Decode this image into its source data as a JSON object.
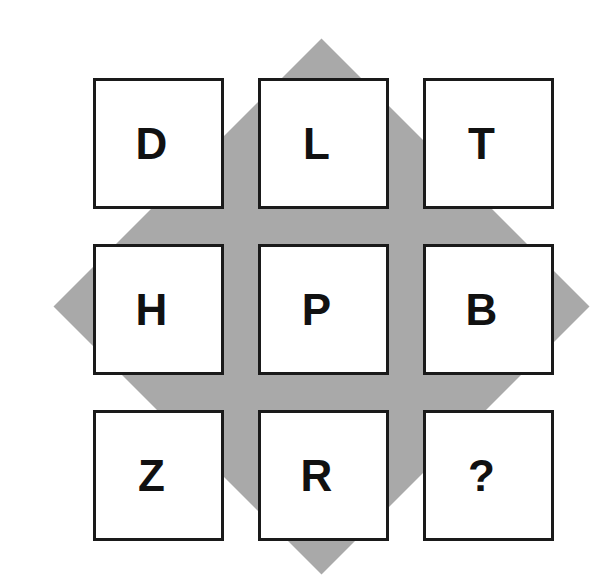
{
  "puzzle": {
    "type": "letter-grid-reasoning-puzzle",
    "background_color": "#ffffff",
    "diamond": {
      "name": "gray-diamond-background",
      "color": "#a9a9a9",
      "center_x": 322,
      "center_y": 307,
      "half_diagonal": 268,
      "top_point_y": 39,
      "bottom_point_y": 575,
      "left_point_x": 54,
      "right_point_x": 590
    },
    "grid": {
      "rows": 3,
      "columns": 3,
      "cell_size": 131,
      "gap": 34,
      "border_color": "#1a1a1a",
      "border_width": 3,
      "cell_fill": "#ffffff",
      "text_color": "#111111",
      "cells": [
        {
          "id": "r1c1",
          "label": "D",
          "row": 1,
          "col": 1
        },
        {
          "id": "r1c2",
          "label": "L",
          "row": 1,
          "col": 2
        },
        {
          "id": "r1c3",
          "label": "T",
          "row": 1,
          "col": 3
        },
        {
          "id": "r2c1",
          "label": "H",
          "row": 2,
          "col": 1
        },
        {
          "id": "r2c2",
          "label": "P",
          "row": 2,
          "col": 2
        },
        {
          "id": "r2c3",
          "label": "B",
          "row": 2,
          "col": 3
        },
        {
          "id": "r3c1",
          "label": "Z",
          "row": 3,
          "col": 1
        },
        {
          "id": "r3c2",
          "label": "R",
          "row": 3,
          "col": 2
        },
        {
          "id": "r3c3",
          "label": "?",
          "row": 3,
          "col": 3
        }
      ]
    }
  }
}
